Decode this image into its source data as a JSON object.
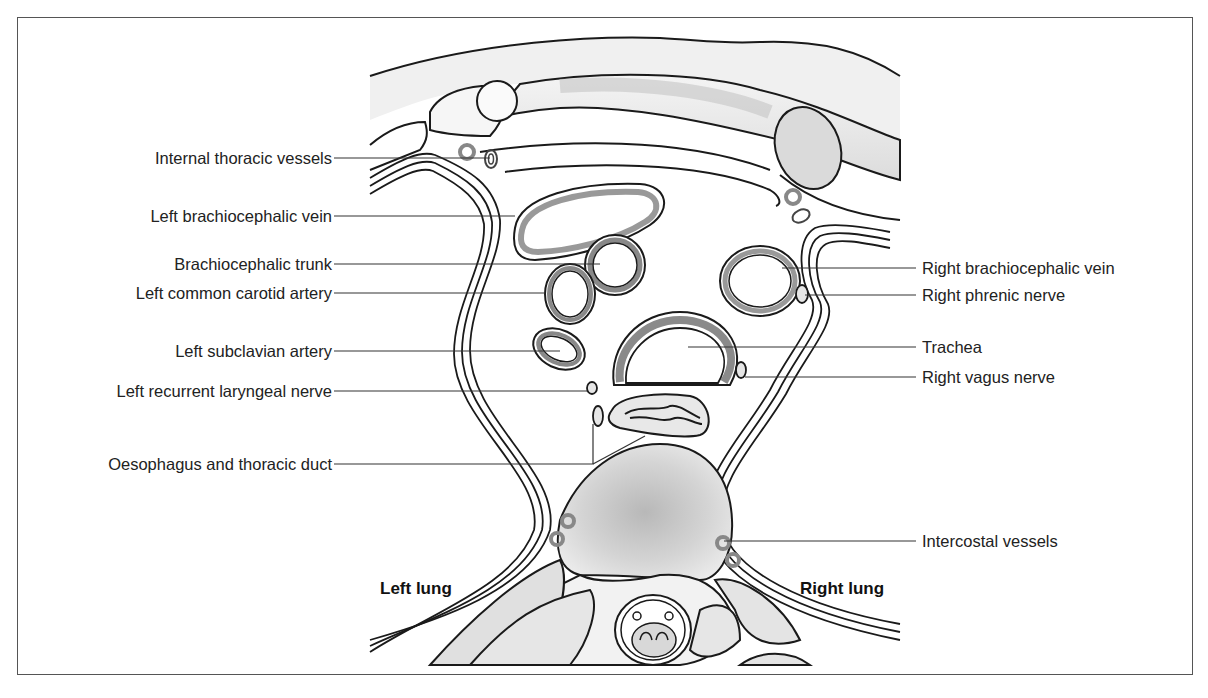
{
  "figure": {
    "type": "anatomical cross-section diagram",
    "colors": {
      "outline": "#1a1a1a",
      "vessel_wall": "#8a8a8a",
      "bone_fill": "#d9d9d9",
      "soft_fill": "#ececec",
      "leader_line": "#333333",
      "text": "#222222"
    },
    "left_labels": [
      {
        "text": "Internal thoracic vessels"
      },
      {
        "text": "Left brachiocephalic vein"
      },
      {
        "text": "Brachiocephalic trunk"
      },
      {
        "text": "Left common carotid artery"
      },
      {
        "text": "Left subclavian artery"
      },
      {
        "text": "Left recurrent laryngeal nerve"
      },
      {
        "text": "Oesophagus and thoracic duct"
      }
    ],
    "right_labels": [
      {
        "text": "Right brachiocephalic vein"
      },
      {
        "text": "Right phrenic nerve"
      },
      {
        "text": "Trachea"
      },
      {
        "text": "Right vagus nerve"
      },
      {
        "text": "Intercostal vessels"
      }
    ],
    "region_labels": {
      "left_lung": "Left lung",
      "right_lung": "Right lung"
    }
  }
}
